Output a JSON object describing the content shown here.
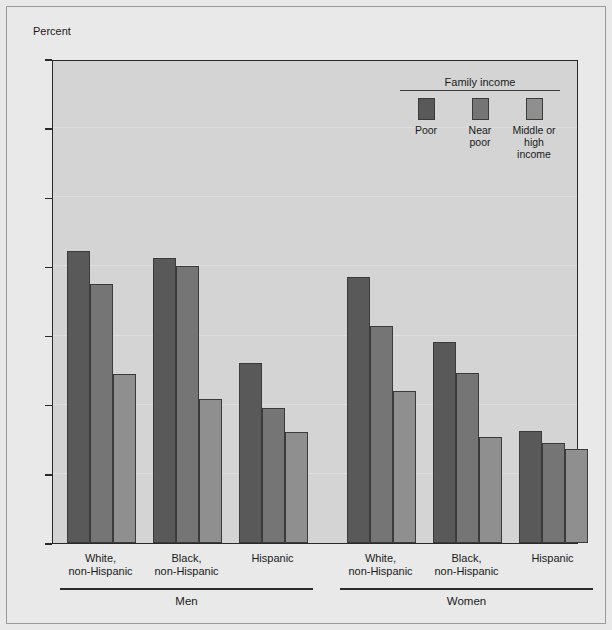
{
  "chart_data": {
    "type": "bar",
    "title": "",
    "ylabel": "Percent",
    "xlabel": "",
    "ylim": [
      0,
      70
    ],
    "yticks": [
      0,
      10,
      20,
      30,
      40,
      50,
      60,
      70
    ],
    "grid": true,
    "legend_position": "top-right",
    "legend_title": "Family income",
    "categories": [
      "White, non-Hispanic",
      "Black, non-Hispanic",
      "Hispanic",
      "White, non-Hispanic",
      "Black, non-Hispanic",
      "Hispanic"
    ],
    "supergroups": [
      "Men",
      "Women"
    ],
    "series": [
      {
        "name": "Poor",
        "color": "#595959",
        "values": [
          42.3,
          41.2,
          26.1,
          38.5,
          29.1,
          16.2
        ]
      },
      {
        "name": "Near poor",
        "color": "#757575",
        "values": [
          37.5,
          40.0,
          19.5,
          31.4,
          24.6,
          14.4
        ]
      },
      {
        "name": "Middle or high income",
        "color": "#8f8f8f",
        "values": [
          24.5,
          20.9,
          16.1,
          22.0,
          15.4,
          13.6
        ]
      }
    ]
  },
  "axis": {
    "y_title": "Percent",
    "tick_labels": [
      "70",
      "60",
      "50",
      "40",
      "30",
      "20",
      "10",
      "0"
    ]
  },
  "legend": {
    "title": "Family income",
    "items": [
      {
        "label": "Poor",
        "color": "#595959"
      },
      {
        "label": "Near\npoor",
        "color": "#757575"
      },
      {
        "label": "Middle or\nhigh income",
        "color": "#8f8f8f"
      }
    ]
  },
  "x_axis": {
    "category_labels": [
      "White,\nnon-Hispanic",
      "Black,\nnon-Hispanic",
      "Hispanic",
      "White,\nnon-Hispanic",
      "Black,\nnon-Hispanic",
      "Hispanic"
    ],
    "group_labels": [
      "Men",
      "Women"
    ]
  }
}
